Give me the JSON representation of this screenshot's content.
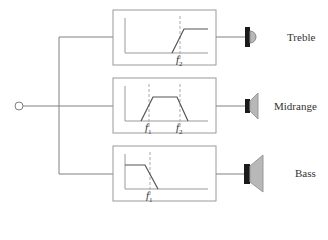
{
  "diagram": {
    "colors": {
      "line": "#808080",
      "box": "#9a9a9a",
      "speaker_fill": "#b8b8b8",
      "driver": "#1a1a1a",
      "dashed": "#aaaaaa"
    },
    "channels": [
      {
        "name": "Treble",
        "filter": "high-pass",
        "freq_labels": [
          "f2"
        ]
      },
      {
        "name": "Midrange",
        "filter": "band-pass",
        "freq_labels": [
          "f1",
          "f2"
        ]
      },
      {
        "name": "Bass",
        "filter": "low-pass",
        "freq_labels": [
          "f1"
        ]
      }
    ],
    "labels": {
      "treble": "Treble",
      "midrange": "Midrange",
      "bass": "Bass",
      "f1": "f",
      "f2": "f",
      "sub1": "1",
      "sub2": "2"
    }
  }
}
